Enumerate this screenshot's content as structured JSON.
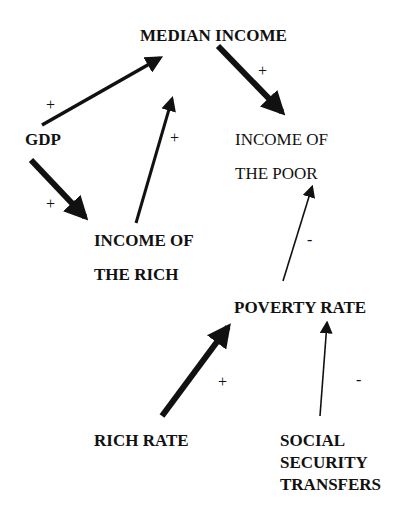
{
  "diagram": {
    "type": "causal-loop",
    "nodes": {
      "median_income": {
        "lines": [
          "MEDIAN INCOME"
        ],
        "style": "bold"
      },
      "gdp": {
        "lines": [
          "GDP"
        ],
        "style": "bold"
      },
      "income_poor": {
        "lines": [
          "INCOME OF",
          "THE POOR"
        ],
        "style": "regular"
      },
      "income_rich": {
        "lines": [
          "INCOME OF",
          "THE RICH"
        ],
        "style": "bold"
      },
      "poverty_rate": {
        "lines": [
          "POVERTY RATE"
        ],
        "style": "bold"
      },
      "rich_rate": {
        "lines": [
          "RICH RATE"
        ],
        "style": "bold"
      },
      "social_security": {
        "lines": [
          "SOCIAL",
          "SECURITY",
          "TRANSFERS"
        ],
        "style": "bold"
      }
    },
    "edges": [
      {
        "from": "gdp",
        "to": "median_income",
        "sign": "+",
        "weight": "medium"
      },
      {
        "from": "median_income",
        "to": "income_poor",
        "sign": "+",
        "weight": "heavy"
      },
      {
        "from": "gdp",
        "to": "income_rich",
        "sign": "+",
        "weight": "heavy"
      },
      {
        "from": "income_rich",
        "to": "median_income",
        "sign": "+",
        "weight": "medium"
      },
      {
        "from": "poverty_rate",
        "to": "income_poor",
        "sign": "-",
        "weight": "light"
      },
      {
        "from": "rich_rate",
        "to": "poverty_rate",
        "sign": "+",
        "weight": "heavy"
      },
      {
        "from": "social_security",
        "to": "poverty_rate",
        "sign": "-",
        "weight": "light"
      }
    ],
    "colors": {
      "ink": "#111111",
      "background": "#ffffff"
    }
  }
}
